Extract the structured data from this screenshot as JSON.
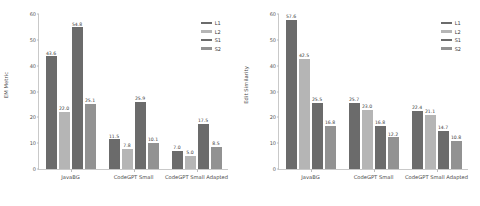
{
  "chart_data": [
    {
      "type": "bar",
      "title": "",
      "xlabel": "",
      "ylabel": "EM Metric",
      "ylim": [
        0,
        60
      ],
      "yticks": [
        0,
        10,
        20,
        30,
        40,
        50,
        60
      ],
      "grid": false,
      "legend_position": "upper right",
      "categories": [
        "JavaBG",
        "CodeGPT Small",
        "CodeGPT Small Adapted"
      ],
      "series": [
        {
          "name": "L1",
          "color": "#6b6b6b",
          "values": [
            43.6,
            11.5,
            7.0
          ]
        },
        {
          "name": "L2",
          "color": "#b5b5b5",
          "values": [
            22.0,
            7.8,
            5.0
          ]
        },
        {
          "name": "S1",
          "color": "#6b6b6b",
          "values": [
            54.8,
            25.9,
            17.5
          ]
        },
        {
          "name": "S2",
          "color": "#929292",
          "values": [
            25.1,
            10.1,
            8.5
          ]
        }
      ]
    },
    {
      "type": "bar",
      "title": "",
      "xlabel": "",
      "ylabel": "Edit Similarity",
      "ylim": [
        0,
        60
      ],
      "yticks": [
        0,
        10,
        20,
        30,
        40,
        50,
        60
      ],
      "grid": false,
      "legend_position": "upper right",
      "categories": [
        "JavaBG",
        "CodeGPT Small",
        "CodeGPT Small Adapted"
      ],
      "series": [
        {
          "name": "L1",
          "color": "#6b6b6b",
          "values": [
            57.6,
            25.7,
            22.4
          ]
        },
        {
          "name": "L2",
          "color": "#b5b5b5",
          "values": [
            42.5,
            23.0,
            21.1
          ]
        },
        {
          "name": "S1",
          "color": "#6b6b6b",
          "values": [
            25.5,
            16.8,
            14.7
          ]
        },
        {
          "name": "S2",
          "color": "#929292",
          "values": [
            16.8,
            12.2,
            10.8
          ]
        }
      ]
    }
  ]
}
